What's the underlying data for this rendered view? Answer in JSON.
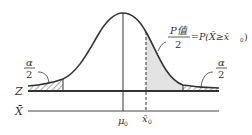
{
  "diagram": {
    "type": "normal-distribution-two-tailed-test",
    "axes": {
      "z_label": "Z",
      "xbar_label": "X̄"
    },
    "ticks": {
      "mu0": "μ",
      "mu0_sub": "0",
      "xbar0": "x̄",
      "xbar0_sub": "0"
    },
    "annotations": {
      "left_alpha_num": "α",
      "left_alpha_den": "2",
      "right_alpha_num": "α",
      "right_alpha_den": "2",
      "p_num": "P值",
      "p_den": "2",
      "p_expr": "=P(X̄≥x̄",
      "p_expr_sub": "0",
      "p_expr_close": ")"
    },
    "colors": {
      "line": "#333333",
      "shade": "#e3e3e3",
      "hatch": "#555555"
    }
  }
}
